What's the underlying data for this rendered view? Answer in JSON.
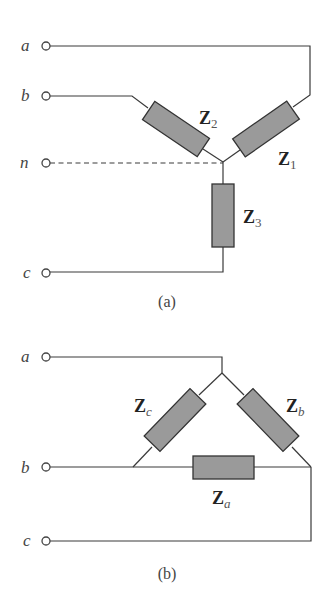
{
  "figure_a": {
    "caption": "(a)",
    "type": "wye-connected load",
    "terminals": [
      {
        "label": "a"
      },
      {
        "label": "b"
      },
      {
        "label": "n"
      },
      {
        "label": "c"
      }
    ],
    "impedances": [
      {
        "main": "Z",
        "sub": "1"
      },
      {
        "main": "Z",
        "sub": "2"
      },
      {
        "main": "Z",
        "sub": "3"
      }
    ]
  },
  "figure_b": {
    "caption": "(b)",
    "type": "delta-connected load",
    "terminals": [
      {
        "label": "a"
      },
      {
        "label": "b"
      },
      {
        "label": "c"
      }
    ],
    "impedances": [
      {
        "main": "Z",
        "sub": "a"
      },
      {
        "main": "Z",
        "sub": "b"
      },
      {
        "main": "Z",
        "sub": "c"
      }
    ]
  },
  "colors": {
    "wire": "#3a3a3a",
    "impedance_fill": "#9a9a9a",
    "background": "#ffffff"
  }
}
